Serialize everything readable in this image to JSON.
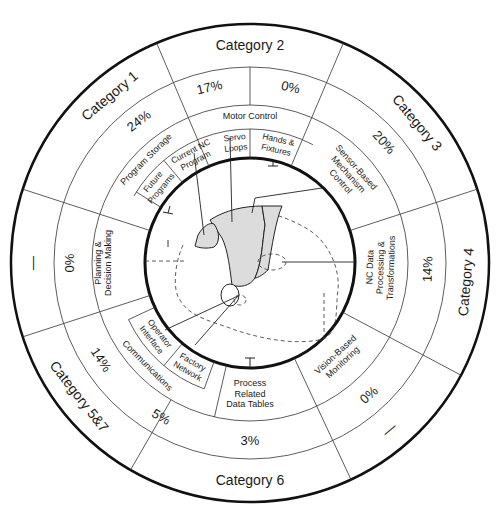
{
  "diagram": {
    "center": [
      250,
      263
    ],
    "radii": {
      "outer": 239,
      "category_inner": 196,
      "percent_inner": 158,
      "sub_inner": 134,
      "core": 105
    },
    "colors": {
      "line": "#333333",
      "thick": "#111111",
      "shade": "#dcdcdc",
      "text": "#1a1a1a"
    },
    "categories": [
      {
        "id": "cat2",
        "label": "Category 2",
        "angle": 0
      },
      {
        "id": "cat3",
        "label": "Category 3",
        "angle": 50
      },
      {
        "id": "cat4",
        "label": "Category 4",
        "angle": 95
      },
      {
        "id": "cat4_5_dash",
        "label": "—",
        "angle": 140
      },
      {
        "id": "cat6",
        "label": "Category 6",
        "angle": 180
      },
      {
        "id": "cat57",
        "label": "Category 5&7",
        "angle": 232
      },
      {
        "id": "cat1_dash",
        "label": "—",
        "angle": 270
      },
      {
        "id": "cat1",
        "label": "Category 1",
        "angle": 320
      }
    ],
    "percents": [
      {
        "label": "17%",
        "angle": -13
      },
      {
        "label": "0%",
        "angle": 13
      },
      {
        "label": "20%",
        "angle": 48
      },
      {
        "label": "14%",
        "angle": 92
      },
      {
        "label": "0%",
        "angle": 138
      },
      {
        "label": "3%",
        "angle": 180
      },
      {
        "label": "5%",
        "angle": 210
      },
      {
        "label": "14%",
        "angle": 237
      },
      {
        "label": "0%",
        "angle": 270
      },
      {
        "label": "24%",
        "angle": 322
      }
    ],
    "subfunctions": [
      {
        "label": "Motor Control",
        "lines": [
          "Motor Control"
        ],
        "angle": 0,
        "ring": "percent_sub"
      },
      {
        "label": "Sensor-Based Mechanism Control",
        "lines": [
          "Sensor-Based",
          "Mechanism",
          "Control"
        ],
        "angle": 48
      },
      {
        "label": "NC Data Processing & Transformations",
        "lines": [
          "NC Data",
          "Processing &",
          "Transformations"
        ],
        "angle": 92
      },
      {
        "label": "Vision-Based Monitoring",
        "lines": [
          "Vision-Based",
          "Monitoring"
        ],
        "angle": 137
      },
      {
        "label": "Process Related Data Tables",
        "lines": [
          "Process",
          "Related",
          "Data Tables"
        ],
        "angle": 180
      },
      {
        "label": "Communications",
        "lines": [
          "Communications"
        ],
        "angle": 225
      },
      {
        "label": "Planning & Decision Making",
        "lines": [
          "Planning &",
          "Decision Making"
        ],
        "angle": 270
      },
      {
        "label": "Program Storage",
        "lines": [
          "Program Storage"
        ],
        "angle": 315
      }
    ],
    "inner_cells": [
      {
        "label": "Servo Loops",
        "lines": [
          "Servo",
          "Loops"
        ],
        "angle": -7
      },
      {
        "label": "Hands & Fixtures",
        "lines": [
          "Hands &",
          "Fixtures"
        ],
        "angle": 13
      },
      {
        "label": "Current NC Program",
        "lines": [
          "Current NC",
          "Program"
        ],
        "angle": -28
      },
      {
        "label": "Future Programs",
        "lines": [
          "Future",
          "Programs"
        ],
        "angle": -50
      },
      {
        "label": "Operator Interface",
        "lines": [
          "Operator",
          "Interface"
        ],
        "angle": 232
      },
      {
        "label": "Factory Network",
        "lines": [
          "Factory",
          "Network"
        ],
        "angle": 210
      }
    ]
  }
}
